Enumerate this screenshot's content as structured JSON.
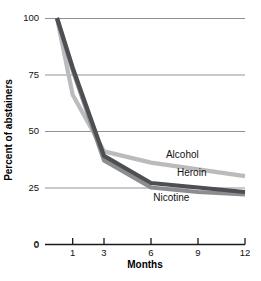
{
  "chart_data": {
    "type": "line",
    "title": "",
    "xlabel": "Months",
    "ylabel": "Percent of abstainers",
    "x": [
      0,
      1,
      3,
      6,
      9,
      12
    ],
    "xtick_labels": [
      "0",
      "1",
      "3",
      "6",
      "9",
      "12"
    ],
    "xtick_values": [
      0,
      1,
      3,
      6,
      9,
      12
    ],
    "ytick_labels": [
      "0",
      "25",
      "50",
      "75",
      "100"
    ],
    "ytick_values": [
      0,
      25,
      50,
      75,
      100
    ],
    "xlim": [
      0,
      12
    ],
    "ylim": [
      0,
      100
    ],
    "grid": "horizontal",
    "legend_position": "inline-right",
    "series": [
      {
        "name": "Alcohol",
        "color": "#b9bbbd",
        "values": [
          100,
          66,
          41,
          36,
          33,
          30
        ]
      },
      {
        "name": "Heroin",
        "color": "#4d4f52",
        "values": [
          100,
          78,
          39,
          27,
          25,
          23
        ]
      },
      {
        "name": "Nicotine",
        "color": "#8b8d90",
        "values": [
          100,
          77,
          37,
          25,
          23,
          22
        ]
      }
    ],
    "annotations": [
      {
        "text": "Alcohol",
        "x": 8.0,
        "y": 38
      },
      {
        "text": "Heroin",
        "x": 8.6,
        "y": 30
      },
      {
        "text": "Nicotine",
        "x": 7.3,
        "y": 19
      }
    ]
  },
  "axes": {
    "y_title": "Percent of abstainers",
    "x_title": "Months"
  },
  "colors": {
    "alcohol": "#b9bbbd",
    "heroin": "#4d4f52",
    "nicotine": "#8b8d90",
    "gridline": "#8f9396",
    "axis": "#1a1a1a",
    "background": "#ffffff"
  }
}
